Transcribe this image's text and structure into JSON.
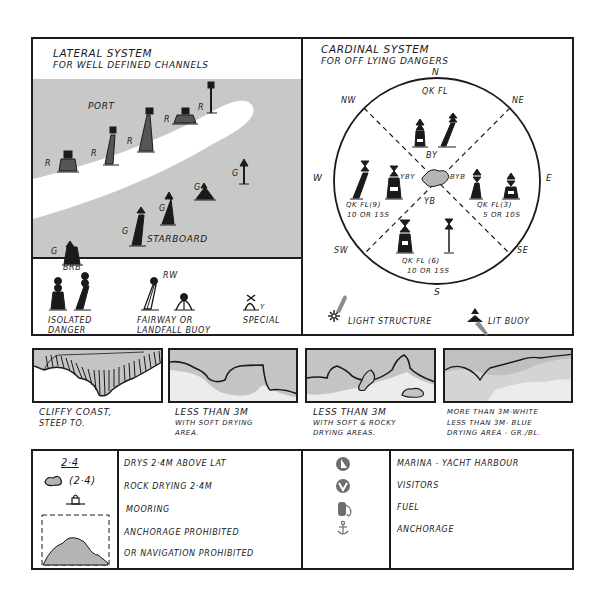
{
  "lateral": {
    "title": "LATERAL SYSTEM",
    "subtitle": "FOR WELL DEFINED CHANNELS",
    "port_label": "PORT",
    "starboard_label": "STARBOARD",
    "port_marker": "R",
    "starboard_marker": "G",
    "water_color": "#c8c8c8",
    "channel_color": "#ffffff"
  },
  "special_marks": {
    "isolated_danger": {
      "code": "BRB",
      "label_line1": "ISOLATED",
      "label_line2": "DANGER"
    },
    "fairway": {
      "code": "RW",
      "label_line1": "FAIRWAY OR",
      "label_line2": "LANDFALL BUOY"
    },
    "special": {
      "code": "Y",
      "label": "SPECIAL"
    }
  },
  "cardinal": {
    "title": "CARDINAL SYSTEM",
    "subtitle": "FOR OFF LYING DANGERS",
    "compass": {
      "n": "N",
      "ne": "NE",
      "e": "E",
      "se": "SE",
      "s": "S",
      "sw": "SW",
      "w": "W",
      "nw": "NW"
    },
    "north": {
      "light": "QK FL",
      "colors": "BY"
    },
    "east": {
      "colors": "BYB",
      "light": "QK FL(3)",
      "period": "5 OR 10S"
    },
    "south": {
      "colors": "YB",
      "light": "QK FL (6)",
      "period": "10 OR 15S"
    },
    "west": {
      "colors": "YBY",
      "light": "QK FL(9)",
      "period": "10 OR 15S"
    },
    "danger_color": "#b4b4b4"
  },
  "legend_lights": {
    "light_structure": "LIGHT STRUCTURE",
    "lit_buoy": "LIT BUOY",
    "flare_color": "#8c8c8c"
  },
  "coastlines": [
    {
      "line1": "CLIFFY COAST,",
      "line2": "STEEP TO.",
      "line3": ""
    },
    {
      "line1": "LESS THAN 3M",
      "line2": "WITH SOFT DRYING",
      "line3": "AREA."
    },
    {
      "line1": "LESS THAN 3M",
      "line2": "WITH SOFT & ROCKY",
      "line3": "DRYING AREAS."
    },
    {
      "line1": "MORE THAN 3M-WHITE",
      "line2": "LESS THAN 3M- BLUE",
      "line3": "DRYING AREA - GR./BL."
    }
  ],
  "symbols_left": {
    "dries_value": "2·4",
    "rock_value": "(2·4)",
    "rows": [
      "DRYS 2·4M ABOVE LAT",
      "ROCK DRYING 2·4M",
      "MOORING",
      "ANCHORAGE PROHIBITED",
      "OR NAVIGATION PROHIBITED"
    ]
  },
  "symbols_right": {
    "rows": [
      {
        "icon": "marina-icon",
        "label": "MARINA - YACHT HARBOUR"
      },
      {
        "icon": "visitors-icon",
        "label": "VISITORS"
      },
      {
        "icon": "fuel-icon",
        "label": "FUEL"
      },
      {
        "icon": "anchor-icon",
        "label": "ANCHORAGE"
      }
    ],
    "icon_color": "#6e6e6e"
  }
}
